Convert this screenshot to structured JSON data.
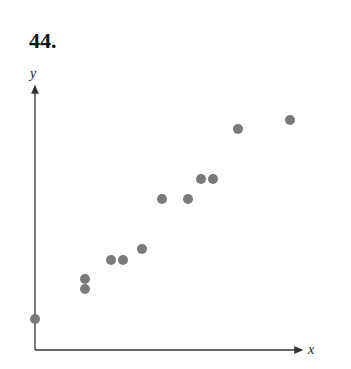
{
  "problem": {
    "number": "44."
  },
  "chart_data": {
    "type": "scatter",
    "title": "",
    "xlabel": "x",
    "ylabel": "y",
    "grid": false,
    "legend": null,
    "ticks": "none",
    "point_color": "#7a7a7a",
    "axis_color": "#333333",
    "points_px": [
      {
        "x": 35,
        "y": 319
      },
      {
        "x": 85,
        "y": 279
      },
      {
        "x": 85,
        "y": 289
      },
      {
        "x": 111,
        "y": 260
      },
      {
        "x": 123,
        "y": 260
      },
      {
        "x": 142,
        "y": 249
      },
      {
        "x": 162,
        "y": 199
      },
      {
        "x": 188,
        "y": 199
      },
      {
        "x": 201,
        "y": 179
      },
      {
        "x": 213,
        "y": 179
      },
      {
        "x": 238,
        "y": 129
      },
      {
        "x": 290,
        "y": 120
      }
    ],
    "points_relative": [
      {
        "x": 0.0,
        "y": 1.2
      },
      {
        "x": 2.0,
        "y": 2.8
      },
      {
        "x": 2.0,
        "y": 2.4
      },
      {
        "x": 3.0,
        "y": 3.6
      },
      {
        "x": 3.5,
        "y": 3.6
      },
      {
        "x": 4.3,
        "y": 4.0
      },
      {
        "x": 5.0,
        "y": 6.0
      },
      {
        "x": 6.1,
        "y": 6.0
      },
      {
        "x": 6.6,
        "y": 6.8
      },
      {
        "x": 7.1,
        "y": 6.8
      },
      {
        "x": 8.1,
        "y": 8.8
      },
      {
        "x": 10.2,
        "y": 9.2
      }
    ]
  }
}
